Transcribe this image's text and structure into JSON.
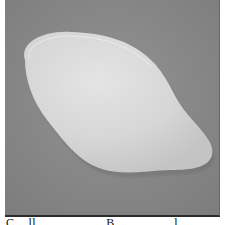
{
  "photo": {
    "subject": "flat-white-pebble-shaped-object",
    "background_color": "#8a8a8a",
    "object_color": "#d9d9d9",
    "object_highlight": "#e6e6e6",
    "object_shadow": "#b8b8b8"
  },
  "caption": {
    "text": "C... ll ... ... ... ... ...B ... ... ... ... l ... ..."
  }
}
